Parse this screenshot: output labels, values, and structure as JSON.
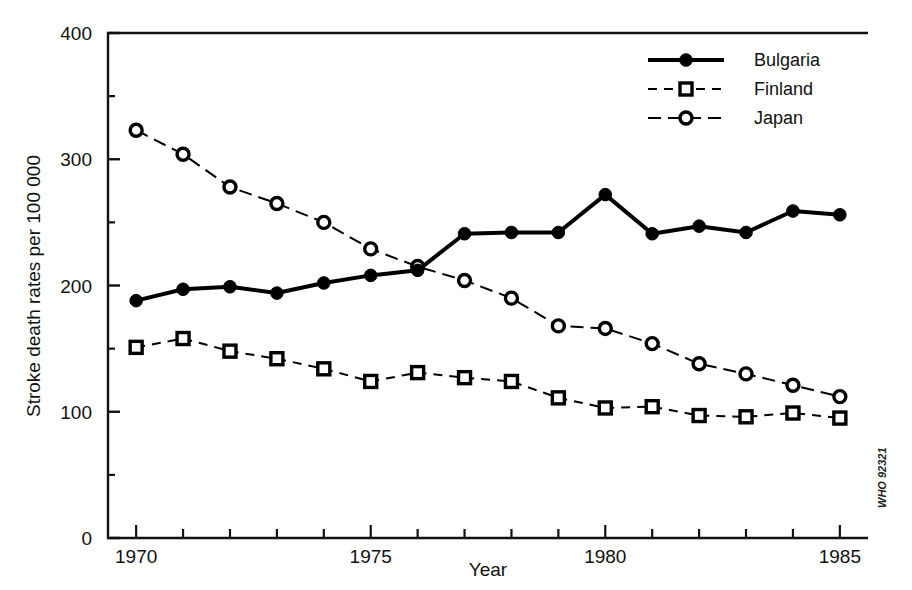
{
  "chart_data": {
    "type": "line",
    "title": "",
    "xlabel": "Year",
    "ylabel": "Stroke death rates per 100 000",
    "xlim": [
      1969.4,
      1985.6
    ],
    "ylim": [
      0,
      400
    ],
    "x_ticks_major": [
      1970,
      1975,
      1980,
      1985
    ],
    "x_ticks_all": [
      1970,
      1971,
      1972,
      1973,
      1974,
      1975,
      1976,
      1977,
      1978,
      1979,
      1980,
      1981,
      1982,
      1983,
      1984,
      1985
    ],
    "x_tick_labels": [
      "1970",
      "1975",
      "1980",
      "1985"
    ],
    "y_ticks_major": [
      0,
      100,
      200,
      300,
      400
    ],
    "y_tick_labels": [
      "0",
      "100",
      "200",
      "300",
      "400"
    ],
    "y_ticks_minor": [
      50,
      150,
      250,
      350
    ],
    "grid": false,
    "legend_position": "top-right",
    "x": [
      1970,
      1971,
      1972,
      1973,
      1974,
      1975,
      1976,
      1977,
      1978,
      1979,
      1980,
      1981,
      1982,
      1983,
      1984,
      1985
    ],
    "series": [
      {
        "name": "Bulgaria",
        "marker": "filled-circle",
        "line_style": "solid",
        "line_width": 4,
        "values": [
          188,
          197,
          199,
          194,
          202,
          208,
          212,
          241,
          242,
          242,
          272,
          241,
          247,
          242,
          259,
          256
        ]
      },
      {
        "name": "Finland",
        "marker": "open-square",
        "line_style": "dashed",
        "line_width": 2,
        "values": [
          151,
          158,
          148,
          142,
          134,
          124,
          131,
          127,
          124,
          111,
          103,
          104,
          97,
          96,
          99,
          95
        ]
      },
      {
        "name": "Japan",
        "marker": "open-circle",
        "line_style": "dash-dot",
        "line_width": 2,
        "values": [
          323,
          304,
          278,
          265,
          250,
          229,
          215,
          204,
          190,
          168,
          166,
          154,
          138,
          130,
          121,
          112
        ]
      }
    ],
    "annotations": [
      {
        "name": "who-reference-code",
        "text": "WHO 92321",
        "position": "right-outside-vertical"
      }
    ]
  },
  "axes": {
    "y_label": "Stroke death rates per 100 000",
    "x_label": "Year",
    "y_tick_labels": [
      "400",
      "300",
      "200",
      "100",
      "0"
    ],
    "x_tick_labels": [
      "1970",
      "1975",
      "1980",
      "1985"
    ]
  },
  "legend": {
    "items": [
      {
        "label": "Bulgaria",
        "marker": "filled-circle",
        "style": "solid"
      },
      {
        "label": "Finland",
        "marker": "open-square",
        "style": "dashed"
      },
      {
        "label": "Japan",
        "marker": "open-circle",
        "style": "dash-dot"
      }
    ]
  },
  "footer": {
    "credit": "WHO 92321"
  },
  "colors": {
    "ink": "#000000",
    "background": "#ffffff"
  }
}
